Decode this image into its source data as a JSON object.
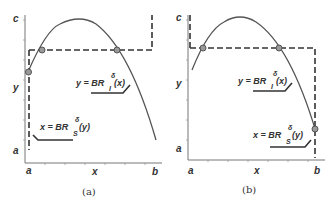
{
  "panels": [
    {
      "caption": "(a)",
      "axis_labels": {
        "x_min": "a",
        "x_mid": "x",
        "x_max": "b",
        "y_min": "a",
        "y_mid": "y",
        "y_max": "c"
      },
      "curve_label": {
        "lhs": "y = BR",
        "sup": "δ",
        "sub": "I",
        "rhs": "(x)"
      },
      "response_label": {
        "lhs": "x = BR",
        "sup": "δ",
        "sub": "S",
        "rhs": "(y)"
      }
    },
    {
      "caption": "(b)",
      "axis_labels": {
        "x_min": "a",
        "x_mid": "x",
        "x_max": "b",
        "y_min": "a",
        "y_mid": "y",
        "y_max": "c"
      },
      "curve_label": {
        "lhs": "y = BR",
        "sup": "δ",
        "sub": "I",
        "rhs": "(x)"
      },
      "response_label": {
        "lhs": "x = BR",
        "sup": "δ",
        "sub": "S",
        "rhs": "(y)"
      }
    }
  ],
  "colors": {
    "curve": "#555555",
    "dashed": "#333333",
    "axis": "#777777",
    "point": "#666666"
  }
}
